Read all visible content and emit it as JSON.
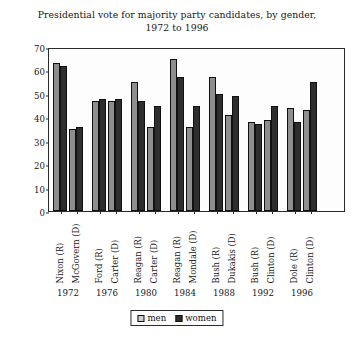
{
  "chart_data": {
    "type": "bar",
    "title": "Presidential vote for majority party candidates, by gender, 1972 to 1996",
    "title_line1": "Presidential vote for majority party candidates, by gender,",
    "title_line2": "1972 to 1996",
    "xlabel": "",
    "ylabel": "% of voters",
    "ylim": [
      0,
      70
    ],
    "ytick_step": 10,
    "yticks": [
      0,
      10,
      20,
      30,
      40,
      50,
      60,
      70
    ],
    "ytick_labels": [
      "0",
      "10",
      "20",
      "30",
      "40",
      "50",
      "60",
      "70"
    ],
    "grid": false,
    "legend_position": "bottom-center",
    "legend": [
      "men",
      "women"
    ],
    "series": [
      {
        "name": "men",
        "color": "#8e8e8e",
        "values": [
          63,
          35,
          47,
          47,
          55,
          36,
          65,
          36,
          57,
          41,
          38,
          39,
          44,
          43
        ]
      },
      {
        "name": "women",
        "color": "#2e2e2e",
        "values": [
          62,
          36,
          48,
          48,
          47,
          45,
          57,
          45,
          50,
          49,
          37,
          45,
          38,
          55
        ]
      }
    ],
    "categories": [
      "Nixon (R)",
      "McGovern (D)",
      "Ford (R)",
      "Carter (D)",
      "Reagan (R)",
      "Carter (D)",
      "Reagan (R)",
      "Mondale (D)",
      "Bush (R)",
      "Dukakis (D)",
      "Bush (R)",
      "Clinton (D)",
      "Dole (R)",
      "Clinton (D)"
    ],
    "groups": [
      {
        "year": "1972",
        "candidates": [
          "Nixon (R)",
          "McGovern (D)"
        ]
      },
      {
        "year": "1976",
        "candidates": [
          "Ford (R)",
          "Carter (D)"
        ]
      },
      {
        "year": "1980",
        "candidates": [
          "Reagan (R)",
          "Carter (D)"
        ]
      },
      {
        "year": "1984",
        "candidates": [
          "Reagan (R)",
          "Mondale (D)"
        ]
      },
      {
        "year": "1988",
        "candidates": [
          "Bush (R)",
          "Dukakis (D)"
        ]
      },
      {
        "year": "1992",
        "candidates": [
          "Bush (R)",
          "Clinton (D)"
        ]
      },
      {
        "year": "1996",
        "candidates": [
          "Dole (R)",
          "Clinton (D)"
        ]
      }
    ],
    "year_labels": [
      "1972",
      "1976",
      "1980",
      "1984",
      "1988",
      "1992",
      "1996"
    ]
  },
  "legend": {
    "men_label": "men",
    "women_label": "women"
  },
  "colors": {
    "men": "#8e8e8e",
    "women": "#2e2e2e",
    "axis": "#2b2b2b",
    "text": "#161616",
    "background": "#ffffff"
  }
}
